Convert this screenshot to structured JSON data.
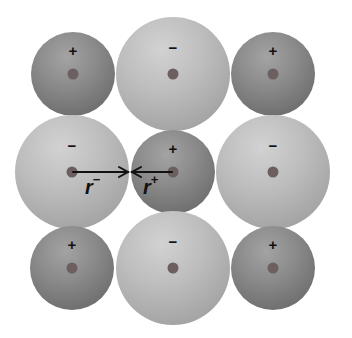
{
  "diagram": {
    "title": "",
    "ions": [
      {
        "id": "r1c1",
        "type": "cation",
        "sign": "+",
        "cx": 73,
        "cy": 74,
        "r": 42
      },
      {
        "id": "r1c2",
        "type": "anion",
        "sign": "−",
        "cx": 173,
        "cy": 74,
        "r": 57
      },
      {
        "id": "r1c3",
        "type": "cation",
        "sign": "+",
        "cx": 273,
        "cy": 74,
        "r": 42
      },
      {
        "id": "r2c1",
        "type": "anion",
        "sign": "−",
        "cx": 72,
        "cy": 172,
        "r": 57
      },
      {
        "id": "r2c2",
        "type": "cation",
        "sign": "+",
        "cx": 173,
        "cy": 172,
        "r": 42
      },
      {
        "id": "r2c3",
        "type": "anion",
        "sign": "−",
        "cx": 273,
        "cy": 172,
        "r": 57
      },
      {
        "id": "r3c1",
        "type": "cation",
        "sign": "+",
        "cx": 72,
        "cy": 268,
        "r": 42
      },
      {
        "id": "r3c2",
        "type": "anion",
        "sign": "−",
        "cx": 173,
        "cy": 268,
        "r": 57
      },
      {
        "id": "r3c3",
        "type": "cation",
        "sign": "+",
        "cx": 273,
        "cy": 268,
        "r": 42
      }
    ],
    "labels": {
      "anion_radius": {
        "base": "r",
        "sup": "−"
      },
      "cation_radius": {
        "base": "r",
        "sup": "+"
      }
    },
    "colors": {
      "cation": "#8a8a8a",
      "anion": "#bdbdbd",
      "nucleus": "#6d5f5f",
      "arrow": "#111111"
    }
  }
}
